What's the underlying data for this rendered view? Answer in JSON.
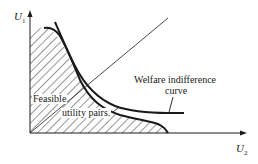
{
  "diagram": {
    "axes": {
      "y_label": "U",
      "y_label_sub": "1",
      "x_label": "U",
      "x_label_sub": "2"
    },
    "labels": {
      "feasible_line1": "Feasible",
      "feasible_line2": "utility pairs.",
      "welfare_line1": "Welfare indifference",
      "welfare_line2": "curve"
    },
    "elements": {
      "feasible_region": "hatched area under utility possibility frontier",
      "frontier": "utility possibility frontier",
      "indifference_curve": "welfare indifference curve",
      "ray": "45-degree line from origin"
    },
    "colors": {
      "ink": "#1a1a1a",
      "background": "#ffffff"
    }
  }
}
